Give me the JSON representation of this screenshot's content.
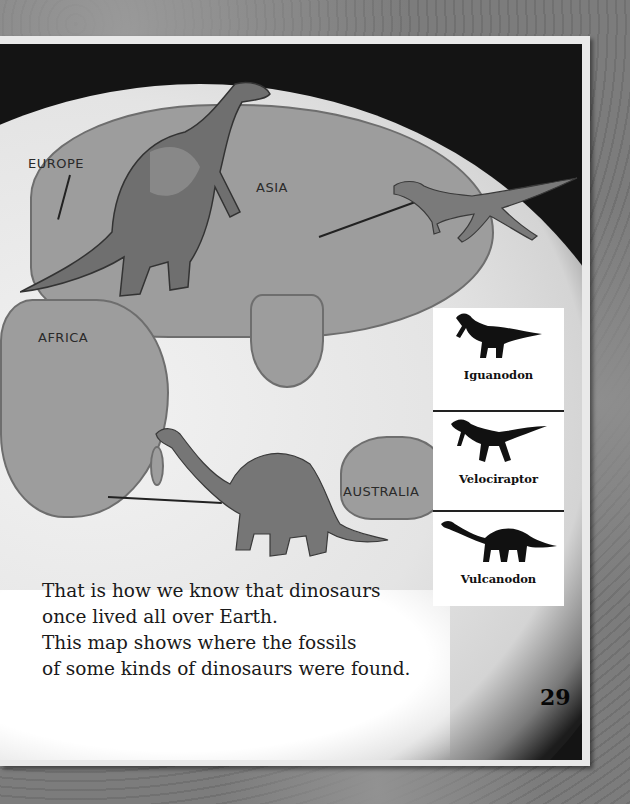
{
  "map": {
    "labels": {
      "europe": "EUROPE",
      "asia": "ASIA",
      "africa": "AFRICA",
      "australia": "AUSTRALIA"
    }
  },
  "legend": {
    "items": [
      {
        "name": "Iguanodon",
        "icon": "iguanodon-silhouette-icon"
      },
      {
        "name": "Velociraptor",
        "icon": "velociraptor-silhouette-icon"
      },
      {
        "name": "Vulcanodon",
        "icon": "vulcanodon-silhouette-icon"
      }
    ]
  },
  "text": {
    "lines": [
      "That is how we know that dinosaurs",
      "once lived all over Earth.",
      "This map shows where the fossils",
      "of some kinds of dinosaurs were found."
    ]
  },
  "page_number": "29",
  "colors": {
    "ocean": "#e6e6e6",
    "land": "#9d9d9d",
    "space": "#141414",
    "border": "#e9e9e9"
  }
}
